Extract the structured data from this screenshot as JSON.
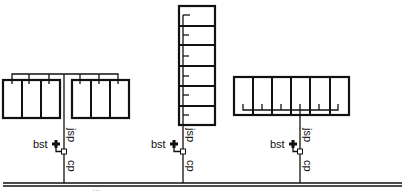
{
  "diagram": {
    "colors": {
      "line": "#111111",
      "background": "#ffffff"
    },
    "labels": {
      "bst": "bst",
      "jsp": "jsp",
      "cp": "cp"
    },
    "configurations": [
      {
        "name": "split-horizontal-arrays",
        "layout": "two groups of 3 panels, header bus above",
        "stem_x": 64
      },
      {
        "name": "vertical-stack",
        "layout": "6 stacked panels with side feeder",
        "stem_x": 180
      },
      {
        "name": "horizontal-row",
        "layout": "6 panels in a row, bus below",
        "stem_x": 300
      }
    ],
    "bus": {
      "description": "main horizontal double line"
    },
    "footnote": "‹‹‹"
  }
}
